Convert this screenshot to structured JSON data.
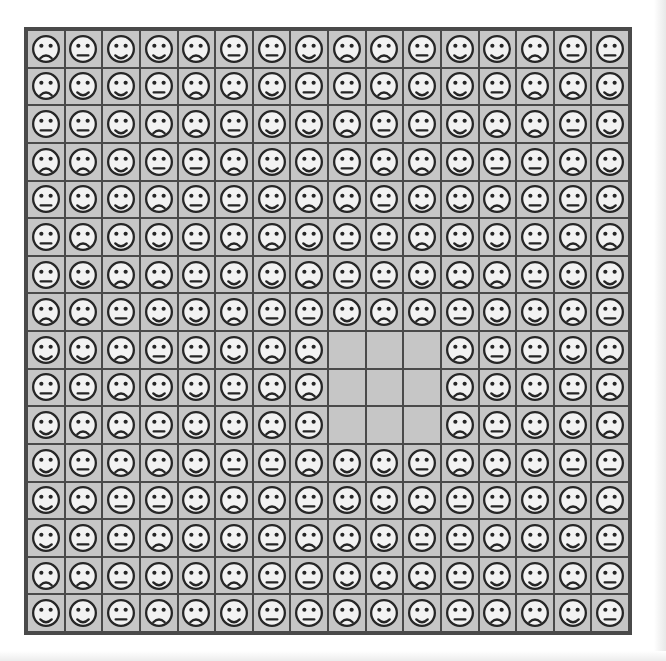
{
  "document": {
    "kind": "matrix-reasoning-puzzle",
    "title": "Emoticon Grid Pattern",
    "background_color": "#ffffff",
    "frame_color": "#4a4a4a",
    "cell_color": "#c6c6c6",
    "face_fill_color": "#f2f2f2",
    "face_ink_color": "#262626"
  },
  "grid": {
    "rows": 16,
    "columns": 16,
    "blank_region": {
      "row_start": 9,
      "row_end": 11,
      "column_start": 9,
      "column_end": 11,
      "label": "missing-tiles"
    },
    "legend": [
      {
        "key": "sad",
        "name": "sad-face",
        "symbol": "frown"
      },
      {
        "key": "neutral",
        "name": "neutral-face",
        "symbol": "straight-mouth"
      },
      {
        "key": "happy",
        "name": "happy-face",
        "symbol": "smile"
      },
      {
        "key": "blank",
        "name": "empty-cell",
        "symbol": "none"
      }
    ],
    "cells": [
      [
        "sad",
        "neutral",
        "happy",
        "happy",
        "sad",
        "neutral",
        "neutral",
        "happy",
        "sad",
        "sad",
        "neutral",
        "happy",
        "happy",
        "sad",
        "neutral",
        "neutral"
      ],
      [
        "sad",
        "happy",
        "happy",
        "neutral",
        "sad",
        "sad",
        "happy",
        "neutral",
        "neutral",
        "sad",
        "happy",
        "happy",
        "neutral",
        "sad",
        "sad",
        "happy"
      ],
      [
        "neutral",
        "neutral",
        "happy",
        "sad",
        "sad",
        "neutral",
        "happy",
        "happy",
        "sad",
        "neutral",
        "neutral",
        "happy",
        "sad",
        "sad",
        "neutral",
        "happy"
      ],
      [
        "sad",
        "sad",
        "happy",
        "neutral",
        "neutral",
        "sad",
        "happy",
        "happy",
        "neutral",
        "sad",
        "sad",
        "happy",
        "neutral",
        "neutral",
        "sad",
        "happy"
      ],
      [
        "neutral",
        "happy",
        "happy",
        "sad",
        "neutral",
        "neutral",
        "happy",
        "sad",
        "sad",
        "neutral",
        "happy",
        "happy",
        "sad",
        "neutral",
        "neutral",
        "happy"
      ],
      [
        "neutral",
        "sad",
        "happy",
        "happy",
        "neutral",
        "sad",
        "sad",
        "happy",
        "neutral",
        "neutral",
        "sad",
        "happy",
        "happy",
        "neutral",
        "sad",
        "sad"
      ],
      [
        "neutral",
        "happy",
        "sad",
        "sad",
        "neutral",
        "happy",
        "happy",
        "sad",
        "neutral",
        "neutral",
        "happy",
        "sad",
        "sad",
        "neutral",
        "happy",
        "happy"
      ],
      [
        "sad",
        "sad",
        "neutral",
        "happy",
        "happy",
        "sad",
        "neutral",
        "neutral",
        "happy",
        "sad",
        "sad",
        "neutral",
        "happy",
        "happy",
        "sad",
        "neutral"
      ],
      [
        "happy",
        "happy",
        "sad",
        "neutral",
        "neutral",
        "happy",
        "sad",
        "sad",
        "blank",
        "blank",
        "blank",
        "sad",
        "neutral",
        "neutral",
        "happy",
        "sad"
      ],
      [
        "neutral",
        "neutral",
        "sad",
        "happy",
        "happy",
        "neutral",
        "sad",
        "sad",
        "blank",
        "blank",
        "blank",
        "sad",
        "happy",
        "happy",
        "neutral",
        "sad"
      ],
      [
        "happy",
        "sad",
        "sad",
        "neutral",
        "happy",
        "happy",
        "sad",
        "neutral",
        "blank",
        "blank",
        "blank",
        "sad",
        "neutral",
        "happy",
        "happy",
        "sad"
      ],
      [
        "happy",
        "neutral",
        "sad",
        "sad",
        "happy",
        "neutral",
        "neutral",
        "sad",
        "happy",
        "happy",
        "neutral",
        "sad",
        "sad",
        "happy",
        "neutral",
        "neutral"
      ],
      [
        "happy",
        "sad",
        "neutral",
        "neutral",
        "happy",
        "sad",
        "sad",
        "neutral",
        "happy",
        "happy",
        "sad",
        "neutral",
        "neutral",
        "happy",
        "sad",
        "sad"
      ],
      [
        "happy",
        "neutral",
        "neutral",
        "sad",
        "happy",
        "happy",
        "neutral",
        "sad",
        "sad",
        "happy",
        "neutral",
        "neutral",
        "sad",
        "happy",
        "happy",
        "neutral"
      ],
      [
        "sad",
        "sad",
        "neutral",
        "happy",
        "happy",
        "sad",
        "neutral",
        "neutral",
        "happy",
        "sad",
        "sad",
        "neutral",
        "happy",
        "happy",
        "sad",
        "neutral"
      ],
      [
        "happy",
        "happy",
        "neutral",
        "sad",
        "sad",
        "happy",
        "neutral",
        "neutral",
        "sad",
        "happy",
        "happy",
        "neutral",
        "sad",
        "sad",
        "happy",
        "neutral"
      ]
    ]
  }
}
